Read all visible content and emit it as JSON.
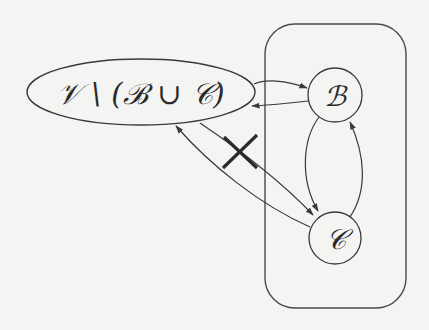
{
  "diagram": {
    "outer_set": {
      "label": "𝒱 \\ (ℬ ∪ 𝒞)",
      "shape": "ellipse"
    },
    "group": {
      "shape": "rounded-rectangle",
      "contains": [
        "B",
        "C"
      ]
    },
    "nodes": [
      {
        "id": "B",
        "label": "ℬ",
        "shape": "circle"
      },
      {
        "id": "C",
        "label": "𝒞",
        "shape": "circle"
      }
    ],
    "edges": [
      {
        "from": "outer",
        "to": "B",
        "status": "allowed"
      },
      {
        "from": "B",
        "to": "outer",
        "status": "allowed"
      },
      {
        "from": "B",
        "to": "C",
        "status": "allowed"
      },
      {
        "from": "C",
        "to": "B",
        "status": "allowed"
      },
      {
        "from": "C",
        "to": "outer",
        "status": "allowed"
      },
      {
        "from": "outer",
        "to": "C",
        "status": "forbidden",
        "marker": "✕"
      }
    ],
    "colors": {
      "stroke": "#3a3a3a",
      "background": "#f4f4f2",
      "cross": "#2b2b2b"
    }
  }
}
